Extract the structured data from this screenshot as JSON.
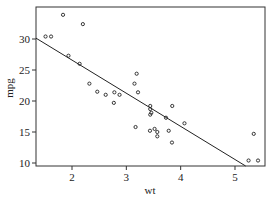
{
  "chart_data": {
    "type": "scatter",
    "title": "",
    "xlabel": "wt",
    "ylabel": "mpg",
    "xlim": [
      1.33,
      5.55
    ],
    "ylim": [
      9.6,
      35.5
    ],
    "x_ticks": [
      2,
      3,
      4,
      5
    ],
    "y_ticks": [
      10,
      15,
      20,
      25,
      30
    ],
    "grid": false,
    "legend": null,
    "points": [
      {
        "x": 2.62,
        "y": 21.0
      },
      {
        "x": 2.875,
        "y": 21.0
      },
      {
        "x": 2.32,
        "y": 22.8
      },
      {
        "x": 3.215,
        "y": 21.4
      },
      {
        "x": 3.44,
        "y": 18.7
      },
      {
        "x": 3.46,
        "y": 18.1
      },
      {
        "x": 3.57,
        "y": 14.3
      },
      {
        "x": 3.19,
        "y": 24.4
      },
      {
        "x": 3.15,
        "y": 22.8
      },
      {
        "x": 3.44,
        "y": 19.2
      },
      {
        "x": 3.44,
        "y": 17.8
      },
      {
        "x": 4.07,
        "y": 16.4
      },
      {
        "x": 3.73,
        "y": 17.3
      },
      {
        "x": 3.78,
        "y": 15.2
      },
      {
        "x": 5.25,
        "y": 10.4
      },
      {
        "x": 5.424,
        "y": 10.4
      },
      {
        "x": 5.345,
        "y": 14.7
      },
      {
        "x": 2.2,
        "y": 32.4
      },
      {
        "x": 1.615,
        "y": 30.4
      },
      {
        "x": 1.835,
        "y": 33.9
      },
      {
        "x": 2.465,
        "y": 21.5
      },
      {
        "x": 3.52,
        "y": 15.5
      },
      {
        "x": 3.435,
        "y": 15.2
      },
      {
        "x": 3.84,
        "y": 13.3
      },
      {
        "x": 3.845,
        "y": 19.2
      },
      {
        "x": 1.935,
        "y": 27.3
      },
      {
        "x": 2.14,
        "y": 26.0
      },
      {
        "x": 1.513,
        "y": 30.4
      },
      {
        "x": 3.17,
        "y": 15.8
      },
      {
        "x": 2.77,
        "y": 19.7
      },
      {
        "x": 3.57,
        "y": 15.0
      },
      {
        "x": 2.78,
        "y": 21.4
      }
    ],
    "regression_line": {
      "intercept": 37.285,
      "slope": -5.344
    }
  },
  "axes": {
    "x_title": "wt",
    "y_title": "mpg",
    "x_tick_labels": [
      "2",
      "3",
      "4",
      "5"
    ],
    "y_tick_labels": [
      "10",
      "15",
      "20",
      "25",
      "30"
    ]
  }
}
